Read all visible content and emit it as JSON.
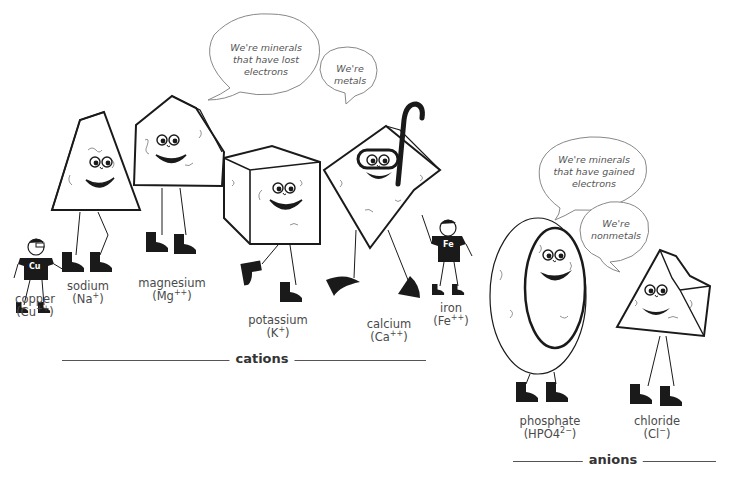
{
  "groups": {
    "cations": {
      "title": "cations"
    },
    "anions": {
      "title": "anions"
    }
  },
  "bubbles": {
    "cations_1": {
      "lines": [
        "We're minerals",
        "that have lost",
        "electrons"
      ]
    },
    "cations_2": {
      "lines": [
        "We're",
        "metals"
      ]
    },
    "anions_1": {
      "lines": [
        "We're minerals",
        "that have gained",
        "electrons"
      ]
    },
    "anions_2": {
      "lines": [
        "We're",
        "nonmetals"
      ]
    }
  },
  "characters": [
    {
      "id": "copper",
      "name": "copper",
      "formula_base": "(Cu",
      "formula_sup": "++",
      "formula_end": ")",
      "shirt": "Cu",
      "shape": "stick-figure"
    },
    {
      "id": "sodium",
      "name": "sodium",
      "formula_base": "(Na",
      "formula_sup": "+",
      "formula_end": ")",
      "shape": "triangle-prism"
    },
    {
      "id": "magnesium",
      "name": "magnesium",
      "formula_base": "(Mg",
      "formula_sup": "++",
      "formula_end": ")",
      "shape": "pentagon-prism"
    },
    {
      "id": "potassium",
      "name": "potassium",
      "formula_base": "(K",
      "formula_sup": "+",
      "formula_end": ")",
      "shape": "cube"
    },
    {
      "id": "calcium",
      "name": "calcium",
      "formula_base": "(Ca",
      "formula_sup": "++",
      "formula_end": ")",
      "shape": "diamond-snorkel"
    },
    {
      "id": "iron",
      "name": "iron",
      "formula_base": "(Fe",
      "formula_sup": "++",
      "formula_end": ")",
      "shirt": "Fe",
      "shape": "stick-figure"
    },
    {
      "id": "phosphate",
      "name": "phosphate",
      "formula_base": "(HPO4",
      "formula_sup": "2−",
      "formula_end": ")",
      "shape": "oval"
    },
    {
      "id": "chloride",
      "name": "chloride",
      "formula_base": "(Cl",
      "formula_sup": "−",
      "formula_end": ")",
      "shape": "broken-pyramid"
    }
  ],
  "colors": {
    "ink": "#1a1a1a",
    "texture": "#777777",
    "line": "#555555",
    "text": "#4a4a4a"
  }
}
